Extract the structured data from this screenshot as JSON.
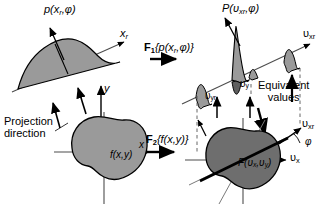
{
  "figure": {
    "background_color": "#ffffff",
    "shape_fill": "#9a9a9a",
    "shape_fill_dark": "#6e6e6e",
    "stroke_color": "#000000",
    "axis_color": "#4d4d4d"
  },
  "labels": {
    "projection_profile": "p(x",
    "projection_profile_sub": "r",
    "projection_profile_tail": ",φ)",
    "axis_xr": "x",
    "axis_xr_sub": "r",
    "axis_y": "y",
    "axis_x": "x",
    "projection_direction_line1": "Projection",
    "projection_direction_line2": "direction",
    "object_function": "f(x,y)",
    "transform1_op": "F",
    "transform1_op_sub": "1",
    "transform1_arg": "{p(x",
    "transform1_arg_sub": "r",
    "transform1_arg_tail": ",φ)}",
    "transform2_op": "F",
    "transform2_op_sub": "2",
    "transform2_arg": "{f(x,y)}",
    "spectrum_profile": "P(υ",
    "spectrum_profile_sub": "xr",
    "spectrum_profile_tail": ",φ)",
    "axis_vxr_top": "υ",
    "axis_vxr_top_sub": "xr",
    "axis_vyr": "υ",
    "axis_vyr_sub": "yr",
    "axis_vy": "υ",
    "axis_vy_sub": "y",
    "equivalent_line1": "Equivalent",
    "equivalent_line2": "values",
    "axis_vxr_bottom": "υ",
    "axis_vxr_bottom_sub": "xr",
    "axis_vx": "υ",
    "axis_vx_sub": "x",
    "angle_phi": "φ",
    "spectrum_2d": "F(υ",
    "spectrum_2d_sub": "x",
    "spectrum_2d_mid": ",υ",
    "spectrum_2d_sub2": "y",
    "spectrum_2d_tail": ")"
  }
}
